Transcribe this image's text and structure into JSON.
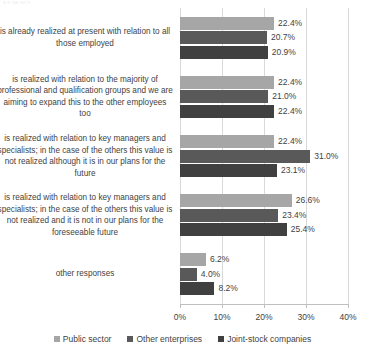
{
  "artifact_text": "a n  na nn  n",
  "chart_data": {
    "type": "bar",
    "orientation": "horizontal",
    "title": "",
    "xlabel": "",
    "ylabel": "",
    "xlim": [
      0,
      40
    ],
    "grid": true,
    "legend_position": "bottom",
    "tick_labels": [
      "0%",
      "10%",
      "20%",
      "30%",
      "40%"
    ],
    "tick_values": [
      0,
      10,
      20,
      30,
      40
    ],
    "categories": [
      "is already realized at present with relation to all those employed",
      "is realized with relation to the majority of professional and qualification groups and we are aiming to expand this to the other employees too",
      "is realized with relation to key managers and specialists; in the case of the others this value is not realized although it is in our plans for the future",
      "is realized with relation to key managers and specialists; in the case of the others this value is not realized and it is not in our plans for the foreseeable future",
      "other responses"
    ],
    "series": [
      {
        "name": "Public sector",
        "color": "#a6a6a6",
        "values": [
          22.4,
          22.4,
          22.4,
          26.6,
          6.2
        ],
        "labels": [
          "22.4%",
          "22.4%",
          "22.4%",
          "26.6%",
          "6.2%"
        ]
      },
      {
        "name": "Other enterprises",
        "color": "#595959",
        "values": [
          20.7,
          21.0,
          31.0,
          23.4,
          4.0
        ],
        "labels": [
          "20.7%",
          "21.0%",
          "31.0%",
          "23.4%",
          "4.0%"
        ]
      },
      {
        "name": "Joint-stock companies",
        "color": "#404040",
        "values": [
          20.9,
          22.4,
          23.1,
          25.4,
          8.2
        ],
        "labels": [
          "20.9%",
          "22.4%",
          "23.1%",
          "25.4%",
          "8.2%"
        ]
      }
    ]
  }
}
